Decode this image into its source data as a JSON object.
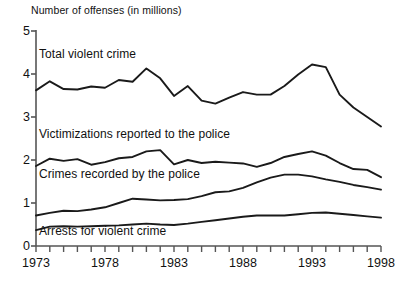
{
  "chart_data": {
    "type": "line",
    "title": "Number of offenses (in millions)",
    "xlabel": "",
    "ylabel": "Number of offenses (in millions)",
    "xlim": [
      1973,
      1998
    ],
    "ylim": [
      0,
      5
    ],
    "grid": false,
    "legend_position": "inline-annotations",
    "y_ticks": [
      0,
      1,
      2,
      3,
      4,
      5
    ],
    "y_tick_labels": [
      "0",
      "1",
      "2",
      "3",
      "4",
      "5"
    ],
    "x_ticks": [
      1973,
      1974,
      1975,
      1976,
      1977,
      1978,
      1979,
      1980,
      1981,
      1982,
      1983,
      1984,
      1985,
      1986,
      1987,
      1988,
      1989,
      1990,
      1991,
      1992,
      1993,
      1994,
      1995,
      1996,
      1997,
      1998
    ],
    "x_tick_labels": [
      "1973",
      "1978",
      "1983",
      "1988",
      "1993",
      "1998"
    ],
    "x_labeled_years": [
      1973,
      1978,
      1983,
      1988,
      1993,
      1998
    ],
    "x": [
      1973,
      1974,
      1975,
      1976,
      1977,
      1978,
      1979,
      1980,
      1981,
      1982,
      1983,
      1984,
      1985,
      1986,
      1987,
      1988,
      1989,
      1990,
      1991,
      1992,
      1993,
      1994,
      1995,
      1996,
      1997,
      1998
    ],
    "series": [
      {
        "name": "Total violent crime",
        "values": [
          3.62,
          3.83,
          3.65,
          3.64,
          3.71,
          3.68,
          3.86,
          3.82,
          4.13,
          3.9,
          3.49,
          3.72,
          3.38,
          3.31,
          3.45,
          3.58,
          3.52,
          3.52,
          3.72,
          3.99,
          4.22,
          4.16,
          3.52,
          3.22,
          3.0,
          2.78
        ]
      },
      {
        "name": "Victimizations reported to the police",
        "values": [
          1.86,
          2.03,
          1.98,
          2.02,
          1.89,
          1.95,
          2.04,
          2.07,
          2.2,
          2.23,
          1.9,
          2.0,
          1.93,
          1.96,
          1.94,
          1.92,
          1.84,
          1.93,
          2.07,
          2.14,
          2.2,
          2.1,
          1.93,
          1.79,
          1.77,
          1.6
        ]
      },
      {
        "name": "Crimes recorded by the police",
        "values": [
          0.71,
          0.77,
          0.82,
          0.81,
          0.85,
          0.9,
          1.0,
          1.1,
          1.08,
          1.06,
          1.07,
          1.09,
          1.16,
          1.25,
          1.27,
          1.35,
          1.48,
          1.59,
          1.66,
          1.66,
          1.62,
          1.55,
          1.49,
          1.42,
          1.37,
          1.31
        ]
      },
      {
        "name": "Arrests for violent crime",
        "values": [
          0.37,
          0.45,
          0.46,
          0.45,
          0.46,
          0.47,
          0.48,
          0.5,
          0.52,
          0.5,
          0.49,
          0.52,
          0.56,
          0.6,
          0.64,
          0.68,
          0.71,
          0.71,
          0.71,
          0.74,
          0.77,
          0.78,
          0.75,
          0.72,
          0.69,
          0.66
        ]
      }
    ],
    "annotations": [
      {
        "text": "Total violent crime"
      },
      {
        "text": "Victimizations reported to the police"
      },
      {
        "text": "Crimes recorded by the police"
      },
      {
        "text": "Arrests for violent crime"
      }
    ],
    "colors": {
      "line": "#1a1a1a",
      "axis": "#555555",
      "text": "#111111",
      "background": "#ffffff"
    }
  }
}
